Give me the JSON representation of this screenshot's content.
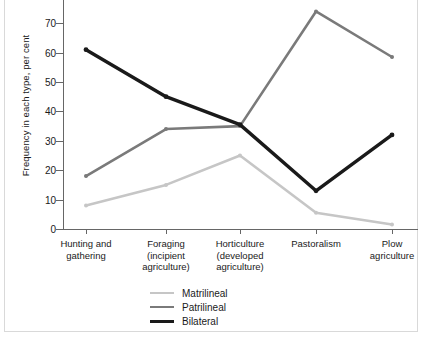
{
  "chart_data": {
    "type": "line",
    "title": "",
    "xlabel": "",
    "ylabel": "Frequency in each type, per cent",
    "ylim": [
      0,
      70
    ],
    "yticks": [
      0,
      10,
      20,
      30,
      40,
      50,
      60,
      70
    ],
    "grid": false,
    "legend_position": "bottom-center",
    "note": "Top of plot is cropped; Patrilineal peak at Pastoralism extends above the visible area.",
    "categories": [
      "Hunting and gathering",
      "Foraging (incipient agriculture)",
      "Horticulture (developed agriculture)",
      "Pastoralism",
      "Plow agriculture"
    ],
    "category_lines": [
      [
        "Hunting and",
        "gathering"
      ],
      [
        "Foraging",
        "(incipient",
        "agriculture)"
      ],
      [
        "Horticulture",
        "(developed",
        "agriculture)"
      ],
      [
        "Pastoralism"
      ],
      [
        "Plow",
        "agriculture"
      ]
    ],
    "series": [
      {
        "name": "Matrilineal",
        "color": "#c6c6c6",
        "values": [
          8,
          15,
          25,
          5.5,
          1.5
        ]
      },
      {
        "name": "Patrilineal",
        "color": "#7a7a7a",
        "values": [
          18,
          34,
          35,
          74,
          58.5
        ]
      },
      {
        "name": "Bilateral",
        "color": "#1a1a1a",
        "values": [
          61,
          45,
          35.5,
          13,
          32
        ]
      }
    ]
  },
  "legend": {
    "entries": [
      {
        "label": "Matrilineal",
        "color": "#c6c6c6",
        "width": 2.5
      },
      {
        "label": "Patrilineal",
        "color": "#7a7a7a",
        "width": 2.5
      },
      {
        "label": "Bilateral",
        "color": "#1a1a1a",
        "width": 3.5
      }
    ]
  }
}
